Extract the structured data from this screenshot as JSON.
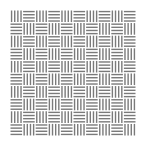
{
  "pattern": {
    "name": "basketweave",
    "rows": 10,
    "cols": 10,
    "lines_per_cell": 4,
    "first_cell_orientation": "vertical",
    "line_color": "#7a7a7a",
    "background_color": "#ffffff"
  }
}
